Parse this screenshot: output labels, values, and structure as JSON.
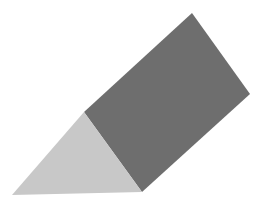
{
  "figure": {
    "type": "triangular-prism",
    "width": 264,
    "height": 212,
    "background": "#ffffff",
    "faces": {
      "rectangular_face": {
        "points": "84,112 192,13 250,94 142,192",
        "fill": "#6e6e6e"
      },
      "triangular_face": {
        "points": "84,112 12,195 142,192",
        "fill": "#c8c8c8"
      }
    }
  }
}
